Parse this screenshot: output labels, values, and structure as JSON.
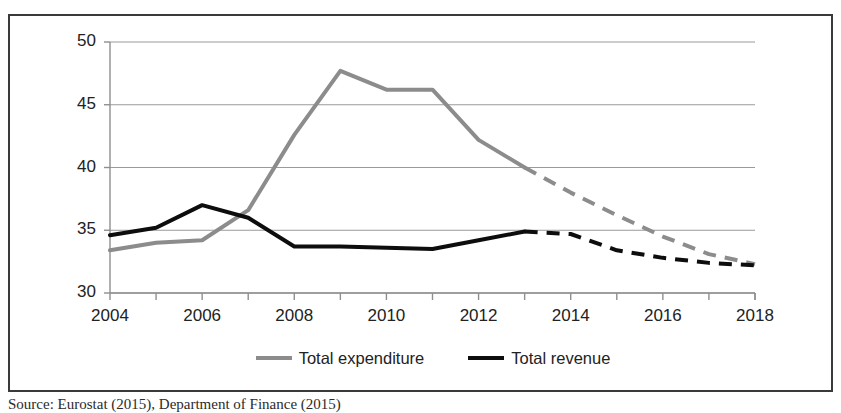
{
  "figure": {
    "source_caption": "Source: Eurostat (2015), Department of Finance (2015)"
  },
  "legend": {
    "position": "bottom-center",
    "items": [
      {
        "label": "Total expenditure",
        "color": "#8c8c8c",
        "name": "legend-total-expenditure"
      },
      {
        "label": "Total revenue",
        "color": "#0d0d0d",
        "name": "legend-total-revenue"
      }
    ]
  },
  "chart_data": {
    "type": "line",
    "title": "",
    "subtitle": "",
    "xlabel": "",
    "ylabel": "",
    "xlim": [
      2004,
      2018
    ],
    "ylim": [
      30,
      50
    ],
    "yticks": [
      30,
      35,
      40,
      45,
      50
    ],
    "ytick_labels": [
      "30",
      "35",
      "40",
      "45",
      "50"
    ],
    "x": [
      2004,
      2005,
      2006,
      2007,
      2008,
      2009,
      2010,
      2011,
      2012,
      2013,
      2014,
      2015,
      2016,
      2017,
      2018
    ],
    "xticks": [
      2004,
      2005,
      2006,
      2007,
      2008,
      2009,
      2010,
      2011,
      2012,
      2013,
      2014,
      2015,
      2016,
      2017,
      2018
    ],
    "xtick_labels_shown": [
      "2004",
      "2006",
      "2008",
      "2010",
      "2012",
      "2014",
      "2016",
      "2018"
    ],
    "xtick_labels_shown_values": [
      2004,
      2006,
      2008,
      2010,
      2012,
      2014,
      2016,
      2018
    ],
    "grid": "horizontal",
    "legend_position": "bottom-center",
    "series": [
      {
        "name": "Total expenditure",
        "color": "#8c8c8c",
        "line_width": 4,
        "solid_through": 2013,
        "values": [
          33.4,
          34.0,
          34.2,
          36.6,
          42.6,
          47.7,
          46.2,
          46.2,
          42.2,
          40.0,
          38.0,
          36.2,
          34.5,
          33.1,
          32.3
        ],
        "annotations": "Solid line 2004-2013 (actual); dashed line 2013-2018 (projection)"
      },
      {
        "name": "Total revenue",
        "color": "#0d0d0d",
        "line_width": 4,
        "solid_through": 2013,
        "values": [
          34.6,
          35.2,
          37.0,
          36.0,
          33.7,
          33.7,
          33.6,
          33.5,
          34.2,
          34.9,
          34.7,
          33.4,
          32.8,
          32.4,
          32.2
        ],
        "annotations": "Solid line 2004-2013 (actual); dashed line 2013-2018 (projection)"
      }
    ]
  }
}
